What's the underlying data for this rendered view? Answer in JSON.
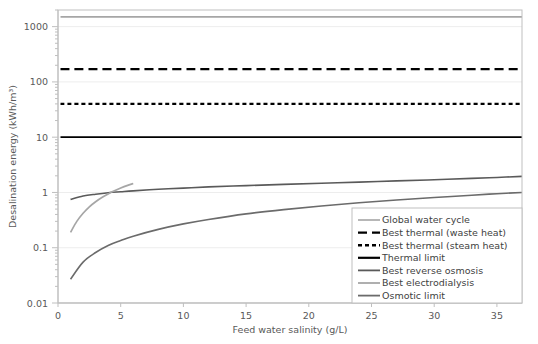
{
  "chart_data": {
    "type": "line",
    "title": "",
    "xlabel": "Feed water salinity (g/L)",
    "ylabel": "Desalination energy (kWh/m³)",
    "xlim": [
      0,
      37
    ],
    "ylim": [
      0.01,
      2000
    ],
    "yscale": "log",
    "xscale": "linear",
    "grid": true,
    "legend_position": "inside-bottom-right",
    "xticks": [
      0,
      5,
      10,
      15,
      20,
      25,
      30,
      35
    ],
    "xtick_labels": [
      "0",
      "5",
      "10",
      "15",
      "20",
      "25",
      "30",
      "35"
    ],
    "yticks": [
      0.01,
      0.1,
      1,
      10,
      100,
      1000
    ],
    "ytick_labels": [
      "0.01",
      "0.1",
      "1",
      "10",
      "100",
      "1000"
    ],
    "series": [
      {
        "name": "Global water cycle",
        "style": "solid",
        "color": "#A6A6A6",
        "width": 1.6,
        "kind": "horizontal",
        "value": 1500,
        "x": [
          0.2,
          37
        ],
        "y": [
          1500,
          1500
        ]
      },
      {
        "name": "Best thermal (waste heat)",
        "style": "long-dash",
        "color": "#000000",
        "width": 2.2,
        "kind": "horizontal",
        "value": 170,
        "x": [
          0.2,
          37
        ],
        "y": [
          170,
          170
        ]
      },
      {
        "name": "Best thermal (steam heat)",
        "style": "short-dash",
        "color": "#000000",
        "width": 2.2,
        "kind": "horizontal",
        "value": 40,
        "x": [
          0.2,
          37
        ],
        "y": [
          40,
          40
        ]
      },
      {
        "name": "Thermal limit",
        "style": "solid",
        "color": "#000000",
        "width": 1.8,
        "kind": "horizontal",
        "value": 10,
        "x": [
          0.2,
          37
        ],
        "y": [
          10,
          10
        ]
      },
      {
        "name": "Best reverse osmosis",
        "style": "solid",
        "color": "#5A5A5A",
        "width": 1.6,
        "kind": "curve",
        "x": [
          1,
          2,
          3,
          4,
          5,
          6,
          8,
          10,
          12,
          15,
          18,
          21,
          24,
          27,
          30,
          33,
          35,
          37
        ],
        "y": [
          0.75,
          0.86,
          0.93,
          0.99,
          1.03,
          1.07,
          1.14,
          1.2,
          1.26,
          1.33,
          1.4,
          1.47,
          1.54,
          1.62,
          1.7,
          1.8,
          1.87,
          1.95
        ]
      },
      {
        "name": "Best electrodialysis",
        "style": "solid",
        "color": "#A6A6A6",
        "width": 1.7,
        "kind": "curve",
        "x": [
          1,
          1.5,
          2,
          2.5,
          3,
          3.5,
          4,
          4.5,
          5,
          5.5,
          6
        ],
        "y": [
          0.19,
          0.3,
          0.42,
          0.55,
          0.68,
          0.81,
          0.94,
          1.07,
          1.2,
          1.33,
          1.45
        ]
      },
      {
        "name": "Osmotic limit",
        "style": "solid",
        "color": "#6B6B6B",
        "width": 1.6,
        "kind": "curve",
        "x": [
          1,
          2,
          3,
          4,
          5,
          6,
          8,
          10,
          12,
          15,
          18,
          21,
          24,
          27,
          30,
          33,
          35,
          37
        ],
        "y": [
          0.027,
          0.055,
          0.082,
          0.11,
          0.135,
          0.162,
          0.215,
          0.27,
          0.325,
          0.41,
          0.49,
          0.57,
          0.65,
          0.73,
          0.81,
          0.89,
          0.95,
          1.0
        ]
      }
    ],
    "legend_entries": [
      {
        "label": "Global water cycle",
        "style": "solid",
        "color": "#A6A6A6",
        "width": 1.6
      },
      {
        "label": "Best thermal (waste heat)",
        "style": "long-dash",
        "color": "#000000",
        "width": 2.4
      },
      {
        "label": "Best thermal (steam heat)",
        "style": "short-dash",
        "color": "#000000",
        "width": 2.4
      },
      {
        "label": "Thermal limit",
        "style": "solid",
        "color": "#000000",
        "width": 2.2
      },
      {
        "label": "Best reverse osmosis",
        "style": "solid",
        "color": "#5A5A5A",
        "width": 1.8
      },
      {
        "label": "Best electrodialysis",
        "style": "solid",
        "color": "#A6A6A6",
        "width": 1.8
      },
      {
        "label": "Osmotic limit",
        "style": "solid",
        "color": "#6B6B6B",
        "width": 1.8
      }
    ],
    "colors": {
      "axis": "#BFBFBF",
      "grid": "#EDEDED",
      "text": "#595959",
      "frame": "#BFBFBF",
      "background": "#FFFFFF"
    }
  }
}
